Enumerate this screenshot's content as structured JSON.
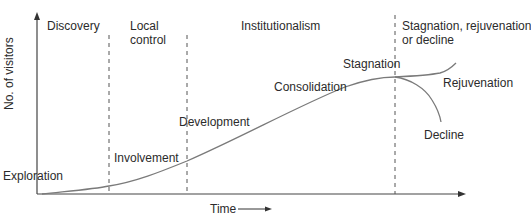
{
  "diagram": {
    "y_axis_label": "No. of visitors",
    "x_axis_label": "Time",
    "x_axis_arrow": "→",
    "eras": [
      {
        "label_line1": "Discovery",
        "label_line2": ""
      },
      {
        "label_line1": "Local",
        "label_line2": "control"
      },
      {
        "label_line1": "Institutionalism",
        "label_line2": ""
      },
      {
        "label_line1": "Stagnation, rejuvenation",
        "label_line2": "or decline"
      }
    ],
    "stages": [
      {
        "label": "Exploration"
      },
      {
        "label": "Involvement"
      },
      {
        "label": "Development"
      },
      {
        "label": "Consolidation"
      },
      {
        "label": "Stagnation"
      },
      {
        "label": "Rejuvenation"
      },
      {
        "label": "Decline"
      }
    ],
    "colors": {
      "line": "#7a7a7a",
      "axis": "#444444",
      "dashed": "#555555",
      "text": "#2b2b2b"
    }
  }
}
